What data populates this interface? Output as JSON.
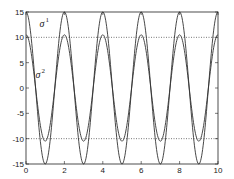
{
  "chart_data": {
    "type": "line",
    "title": "",
    "xlabel": "",
    "ylabel": "",
    "xlim": [
      0,
      10
    ],
    "ylim": [
      -15,
      15
    ],
    "xticks": [
      0,
      2,
      4,
      6,
      8,
      10
    ],
    "yticks": [
      -15,
      -10,
      -5,
      0,
      5,
      10,
      15
    ],
    "grid": false,
    "reference_lines": [
      {
        "y": 10,
        "style": "dotted"
      },
      {
        "y": -10,
        "style": "dotted"
      }
    ],
    "series": [
      {
        "name": "σ1",
        "label_base": "σ",
        "label_sup": "1",
        "amplitude": 15,
        "period": 2,
        "form": "15*cos(pi*x)",
        "x": [
          0,
          1,
          2,
          3,
          4,
          5,
          6,
          7,
          8,
          9,
          10
        ],
        "values": [
          15,
          -15,
          15,
          -15,
          15,
          -15,
          15,
          -15,
          15,
          -15,
          15
        ]
      },
      {
        "name": "σ2",
        "label_base": "σ",
        "label_sup": "2",
        "amplitude": 10.5,
        "period": 2,
        "form": "10.5*cos(pi*x)",
        "x": [
          0,
          1,
          2,
          3,
          4,
          5,
          6,
          7,
          8,
          9,
          10
        ],
        "values": [
          10.5,
          -10.5,
          10.5,
          -10.5,
          10.5,
          -10.5,
          10.5,
          -10.5,
          10.5,
          -10.5,
          10.5
        ]
      }
    ],
    "annotations": [
      {
        "text": "σ1",
        "base": "σ",
        "sup": "1",
        "x": 0.7,
        "y": 12.0
      },
      {
        "text": "σ2",
        "base": "σ",
        "sup": "2",
        "x": 0.5,
        "y": 2.0
      }
    ]
  }
}
